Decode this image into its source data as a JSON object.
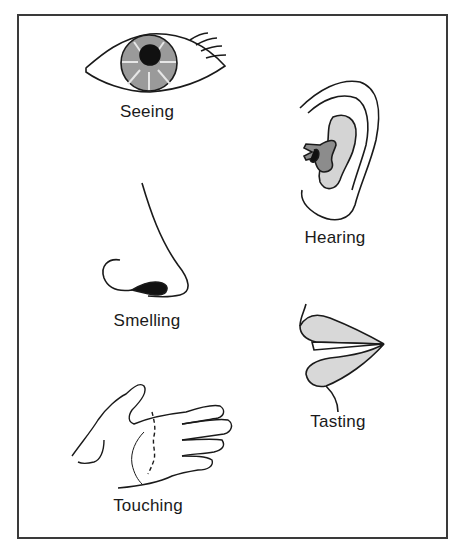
{
  "diagram": {
    "senses": [
      {
        "id": "seeing",
        "label": "Seeing",
        "icon": "eye-icon"
      },
      {
        "id": "hearing",
        "label": "Hearing",
        "icon": "ear-icon"
      },
      {
        "id": "smelling",
        "label": "Smelling",
        "icon": "nose-icon"
      },
      {
        "id": "tasting",
        "label": "Tasting",
        "icon": "mouth-icon"
      },
      {
        "id": "touching",
        "label": "Touching",
        "icon": "hand-icon"
      }
    ],
    "colors": {
      "stroke": "#1a1a1a",
      "iris": "#9a9a9a",
      "pupil": "#111111",
      "ear_inner_light": "#d4d4d4",
      "ear_inner_dark": "#8c8c8c",
      "lip": "#d8d8d8",
      "border": "#3a3a3a"
    }
  }
}
